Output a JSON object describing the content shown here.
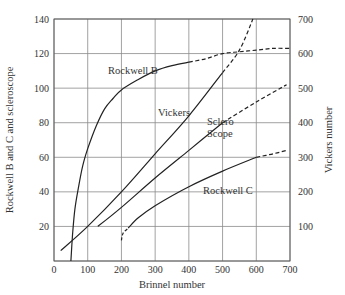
{
  "chart_data": {
    "type": "line",
    "title": "",
    "xlabel": "Brinnel number",
    "ylabel": "Rockwell B and C and scleroscope",
    "ylabel_right": "Vickers number",
    "xlim": [
      0,
      700
    ],
    "ylim": [
      0,
      140
    ],
    "ylim_right": [
      0,
      700
    ],
    "grid": true,
    "legend": "inline labels on curves",
    "x_ticks": [
      "0",
      "100",
      "200",
      "300",
      "400",
      "500",
      "600",
      "700"
    ],
    "y_ticks": [
      "20",
      "40",
      "60",
      "80",
      "100",
      "120",
      "140"
    ],
    "y_ticks_right": [
      "100",
      "200",
      "300",
      "400",
      "500",
      "600",
      "700"
    ],
    "series": [
      {
        "name": "Rockwell B",
        "axis": "left",
        "solid": [
          [
            50,
            0
          ],
          [
            55,
            15
          ],
          [
            62,
            30
          ],
          [
            72,
            42
          ],
          [
            85,
            55
          ],
          [
            100,
            65
          ],
          [
            125,
            78
          ],
          [
            150,
            88
          ],
          [
            175,
            94
          ],
          [
            200,
            99
          ],
          [
            250,
            105
          ],
          [
            300,
            110
          ],
          [
            350,
            113
          ],
          [
            400,
            115
          ]
        ],
        "dashed": [
          [
            400,
            115
          ],
          [
            450,
            117
          ],
          [
            500,
            120
          ],
          [
            550,
            121
          ],
          [
            600,
            122
          ],
          [
            650,
            123
          ],
          [
            700,
            123
          ]
        ]
      },
      {
        "name": "Vickers",
        "axis": "right",
        "solid": [
          [
            20,
            30
          ],
          [
            100,
            100
          ],
          [
            200,
            200
          ],
          [
            300,
            310
          ],
          [
            400,
            420
          ],
          [
            500,
            545
          ]
        ],
        "dashed": [
          [
            500,
            545
          ],
          [
            550,
            610
          ],
          [
            590,
            700
          ]
        ]
      },
      {
        "name": "Sclero Scope",
        "axis": "left",
        "solid": [
          [
            130,
            20
          ],
          [
            200,
            31
          ],
          [
            300,
            48
          ],
          [
            400,
            64
          ],
          [
            500,
            80
          ]
        ],
        "dashed": [
          [
            500,
            80
          ],
          [
            600,
            92
          ],
          [
            690,
            102
          ]
        ]
      },
      {
        "name": "Rockwell C",
        "axis": "left",
        "solid": [
          [
            220,
            19
          ],
          [
            250,
            25
          ],
          [
            300,
            32
          ],
          [
            400,
            43
          ],
          [
            500,
            52
          ],
          [
            600,
            60
          ]
        ],
        "dashed_start": [
          [
            200,
            12
          ],
          [
            205,
            16
          ],
          [
            220,
            19
          ]
        ],
        "dashed": [
          [
            600,
            60
          ],
          [
            650,
            62
          ],
          [
            690,
            64
          ]
        ]
      }
    ],
    "annotations": [
      {
        "text": "Rockwell B",
        "x": 215,
        "y": 114
      },
      {
        "text": "Vickers",
        "x": 260,
        "y": 88
      },
      {
        "text": "Sclero",
        "x": 370,
        "y": 90
      },
      {
        "text": "Scope",
        "x": 370,
        "y": 82
      },
      {
        "text": "Rockwell C",
        "x": 430,
        "y": 40
      }
    ]
  },
  "labels": {
    "xlabel": "Brinnel number",
    "ylabel": "Rockwell B and C and scleroscope",
    "ylabel_right": "Vickers number",
    "rockwell_b": "Rockwell B",
    "vickers": "Vickers",
    "sclero_1": "Sclero",
    "sclero_2": "Scope",
    "rockwell_c": "Rockwell C"
  }
}
